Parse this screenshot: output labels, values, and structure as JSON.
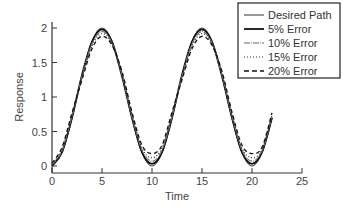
{
  "chart_data": {
    "type": "line",
    "title": "",
    "xlabel": "Time",
    "ylabel": "Response",
    "xlim": [
      0,
      25
    ],
    "ylim": [
      0,
      2
    ],
    "xticks": [
      0,
      5,
      10,
      15,
      20,
      25
    ],
    "yticks": [
      0,
      0.5,
      1,
      1.5,
      2
    ],
    "xtick_labels": [
      "0",
      "5",
      "10",
      "15",
      "20",
      "25"
    ],
    "ytick_labels": [
      "0",
      "0.5",
      "1",
      "1.5",
      "2"
    ],
    "grid": false,
    "legend_position": "upper right",
    "x": [
      0,
      1,
      2,
      3,
      4,
      5,
      6,
      7,
      8,
      9,
      10,
      11,
      12,
      13,
      14,
      15,
      16,
      17,
      18,
      19,
      20,
      21,
      22
    ],
    "series": [
      {
        "name": "Desired Path",
        "style": "solid",
        "values": [
          0,
          0.19,
          0.69,
          1.31,
          1.81,
          2.0,
          1.81,
          1.31,
          0.69,
          0.19,
          0,
          0.19,
          0.69,
          1.31,
          1.81,
          2.0,
          1.81,
          1.31,
          0.69,
          0.19,
          0,
          0.19,
          0.69
        ]
      },
      {
        "name": "5% Error",
        "style": "solid-thick",
        "values": [
          0,
          0.2,
          0.7,
          1.32,
          1.8,
          1.98,
          1.8,
          1.3,
          0.7,
          0.2,
          0.03,
          0.2,
          0.7,
          1.32,
          1.8,
          1.98,
          1.8,
          1.3,
          0.7,
          0.2,
          0.03,
          0.2,
          0.7
        ]
      },
      {
        "name": "10% Error",
        "style": "dash-dot-light",
        "values": [
          0.02,
          0.22,
          0.72,
          1.3,
          1.77,
          1.95,
          1.78,
          1.32,
          0.72,
          0.23,
          0.07,
          0.23,
          0.72,
          1.3,
          1.77,
          1.95,
          1.78,
          1.32,
          0.72,
          0.23,
          0.07,
          0.22,
          0.72
        ]
      },
      {
        "name": "15% Error",
        "style": "dotted",
        "values": [
          0.03,
          0.24,
          0.74,
          1.28,
          1.74,
          1.92,
          1.77,
          1.34,
          0.75,
          0.26,
          0.12,
          0.26,
          0.75,
          1.28,
          1.74,
          1.92,
          1.77,
          1.34,
          0.75,
          0.26,
          0.12,
          0.24,
          0.74
        ]
      },
      {
        "name": "20% Error",
        "style": "dashed",
        "values": [
          0.04,
          0.27,
          0.77,
          1.25,
          1.7,
          1.88,
          1.75,
          1.37,
          0.78,
          0.3,
          0.18,
          0.3,
          0.78,
          1.25,
          1.7,
          1.88,
          1.75,
          1.37,
          0.78,
          0.3,
          0.18,
          0.27,
          0.77
        ]
      }
    ]
  },
  "legend": {
    "items": [
      "Desired Path",
      "5% Error",
      "10% Error",
      "15% Error",
      "20% Error"
    ]
  },
  "axes": {
    "xlabel": "Time",
    "ylabel": "Response"
  }
}
